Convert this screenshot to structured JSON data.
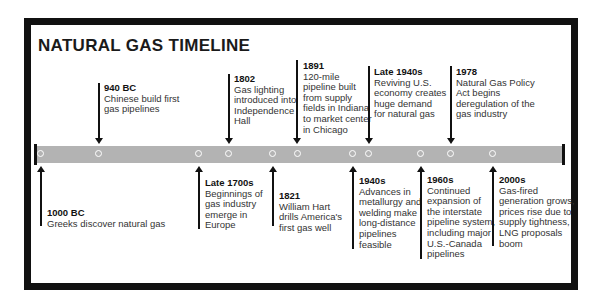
{
  "title": "NATURAL GAS TIMELINE",
  "events_above": [
    {
      "date": "940 BC",
      "desc": "Chinese build first\ngas pipelines"
    },
    {
      "date": "1802",
      "desc": "Gas lighting\nintroduced into\nIndependence\nHall"
    },
    {
      "date": "1891",
      "desc": "120-mile\npipeline built\nfrom supply\nfields in Indiana\nto market center\nin Chicago"
    },
    {
      "date": "Late 1940s",
      "desc": "Reviving U.S.\neconomy creates\nhuge demand\nfor natural gas"
    },
    {
      "date": "1978",
      "desc": "Natural Gas Policy\nAct begins\nderegulation of the\ngas industry"
    }
  ],
  "events_below": [
    {
      "date": "1000 BC",
      "desc": "Greeks discover natural gas"
    },
    {
      "date": "Late 1700s",
      "desc": "Beginnings of\ngas industry\nemerge in\nEurope"
    },
    {
      "date": "1821",
      "desc": "William Hart\ndrills America's\nfirst gas well"
    },
    {
      "date": "1940s",
      "desc": "Advances in\nmetallurgy and\nwelding make\nlong-distance\npipelines\nfeasible"
    },
    {
      "date": "1960s",
      "desc": "Continued\nexpansion of\nthe interstate\npipeline system,\nincluding major\nU.S.-Canada\npipelines"
    },
    {
      "date": "2000s",
      "desc": "Gas-fired\ngeneration grows,\nprices rise due to\nsupply tightness,\nLNG proposals\nboom"
    }
  ],
  "colors": {
    "frame": "#111111",
    "bar": "#b3b3b3",
    "dot": "#ffffff"
  }
}
